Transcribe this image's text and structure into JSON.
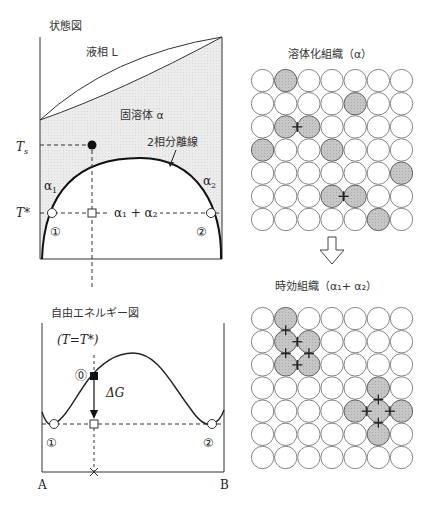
{
  "phase_diagram": {
    "title": "状態図",
    "liquid_label": "液相 L",
    "solid_label": "固溶体 α",
    "miscibility_label": "2相分離線",
    "Ts_label": "T",
    "Ts_sub": "s",
    "Tstar_label": "T*",
    "alpha1_label": "α",
    "alpha1_sub": "1",
    "alpha2_label": "α",
    "alpha2_sub": "2",
    "two_phase_label": "α₁ + α₂",
    "point1_label": "①",
    "point2_label": "②"
  },
  "energy_diagram": {
    "title": "自由エネルギー図",
    "condition_label": "(T=T*)",
    "point0_label": "⓪",
    "deltaG_label": "ΔG",
    "point1_label": "①",
    "point2_label": "②",
    "axis_left": "A",
    "axis_right": "B"
  },
  "solution_structure": {
    "title": "溶体化組織（α）",
    "rows": 7,
    "cols": 7,
    "shaded": [
      [
        0,
        1
      ],
      [
        1,
        4
      ],
      [
        2,
        1
      ],
      [
        2,
        2
      ],
      [
        3,
        0
      ],
      [
        3,
        3
      ],
      [
        4,
        6
      ],
      [
        5,
        3
      ],
      [
        5,
        4
      ],
      [
        6,
        5
      ]
    ],
    "bonds": [
      [
        [
          2,
          1
        ],
        [
          2,
          2
        ]
      ],
      [
        [
          5,
          3
        ],
        [
          5,
          4
        ]
      ]
    ]
  },
  "aged_structure": {
    "title": "時効組織（α₁+ α₂）",
    "rows": 7,
    "cols": 7,
    "shaded": [
      [
        0,
        1
      ],
      [
        1,
        1
      ],
      [
        1,
        2
      ],
      [
        2,
        1
      ],
      [
        2,
        2
      ],
      [
        3,
        5
      ],
      [
        4,
        4
      ],
      [
        4,
        5
      ],
      [
        4,
        6
      ],
      [
        5,
        5
      ]
    ],
    "bonds": [
      [
        [
          0,
          1
        ],
        [
          1,
          1
        ]
      ],
      [
        [
          1,
          1
        ],
        [
          1,
          2
        ]
      ],
      [
        [
          1,
          1
        ],
        [
          2,
          1
        ]
      ],
      [
        [
          1,
          2
        ],
        [
          2,
          2
        ]
      ],
      [
        [
          2,
          1
        ],
        [
          2,
          2
        ]
      ],
      [
        [
          3,
          5
        ],
        [
          4,
          5
        ]
      ],
      [
        [
          4,
          4
        ],
        [
          4,
          5
        ]
      ],
      [
        [
          4,
          5
        ],
        [
          4,
          6
        ]
      ],
      [
        [
          4,
          5
        ],
        [
          5,
          5
        ]
      ]
    ]
  },
  "colors": {
    "shade": "#c8c8c8",
    "solid_region": "#ececec",
    "line": "#222222"
  }
}
